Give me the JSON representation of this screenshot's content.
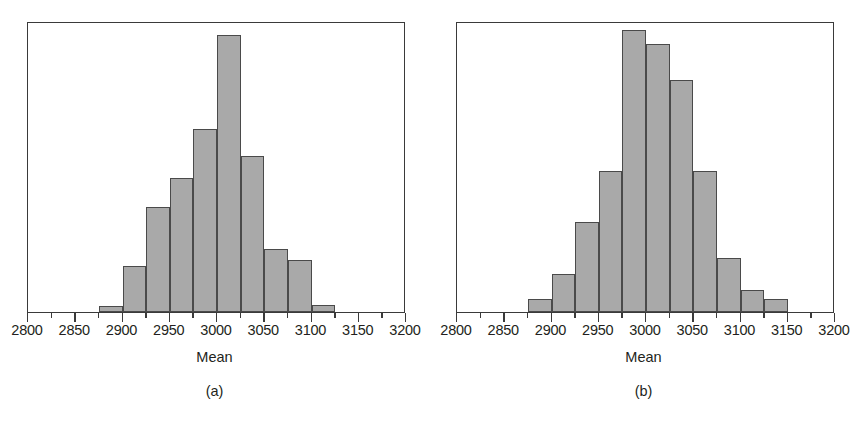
{
  "figure": {
    "background_color": "#ffffff",
    "bar_fill_color": "#a9a9a9",
    "bar_edge_color": "#4a4a4a",
    "frame_color": "#3a3a3a",
    "text_color": "#231f20"
  },
  "panels": [
    {
      "caption": "(a)",
      "axis_title": "Mean",
      "tick_labels": [
        "2800",
        "2850",
        "2900",
        "2950",
        "3000",
        "3050",
        "3100",
        "3150",
        "3200"
      ]
    },
    {
      "caption": "(b)",
      "axis_title": "Mean",
      "tick_labels": [
        "2800",
        "2850",
        "2900",
        "2950",
        "3000",
        "3050",
        "3100",
        "3150",
        "3200"
      ]
    }
  ],
  "chart_data": [
    {
      "type": "bar",
      "title": "(a)",
      "xlabel": "Mean",
      "ylabel": "",
      "grid": false,
      "legend": "none",
      "xlim": [
        2800,
        3200
      ],
      "ylim": [
        0,
        255
      ],
      "bin_width": 25,
      "bin_edges": [
        2875,
        2900,
        2925,
        2950,
        2975,
        3000,
        3025,
        3050,
        3075,
        3100,
        3125
      ],
      "categories": [
        "2875-2900",
        "2900-2925",
        "2925-2950",
        "2950-2975",
        "2975-3000",
        "3000-3025",
        "3025-3050",
        "3050-3075",
        "3075-3100",
        "3100-3125"
      ],
      "values": [
        5,
        40,
        92,
        117,
        160,
        243,
        137,
        55,
        46,
        6
      ],
      "xticks": [
        2800,
        2850,
        2900,
        2950,
        3000,
        3050,
        3100,
        3150,
        3200
      ],
      "xtick_labels": [
        "2800",
        "2850",
        "2900",
        "2950",
        "3000",
        "3050",
        "3100",
        "3150",
        "3200"
      ],
      "minor_xticks": [
        2825,
        2875,
        2925,
        2975,
        3025,
        3075,
        3125,
        3175
      ]
    },
    {
      "type": "bar",
      "title": "(b)",
      "xlabel": "Mean",
      "ylabel": "",
      "grid": false,
      "legend": "none",
      "xlim": [
        2800,
        3200
      ],
      "ylim": [
        0,
        255
      ],
      "bin_width": 25,
      "bin_edges": [
        2875,
        2900,
        2925,
        2950,
        2975,
        3000,
        3025,
        3050,
        3075,
        3100,
        3125,
        3150
      ],
      "categories": [
        "2875-2900",
        "2900-2925",
        "2925-2950",
        "2950-2975",
        "2975-3000",
        "3000-3025",
        "3025-3050",
        "3050-3075",
        "3075-3100",
        "3100-3125",
        "3125-3150"
      ],
      "values": [
        11,
        33,
        79,
        124,
        247,
        235,
        203,
        124,
        47,
        19,
        11
      ],
      "xticks": [
        2800,
        2850,
        2900,
        2950,
        3000,
        3050,
        3100,
        3150,
        3200
      ],
      "xtick_labels": [
        "2800",
        "2850",
        "2900",
        "2950",
        "3000",
        "3050",
        "3100",
        "3150",
        "3200"
      ],
      "minor_xticks": [
        2825,
        2875,
        2925,
        2975,
        3025,
        3075,
        3125,
        3175
      ]
    }
  ]
}
